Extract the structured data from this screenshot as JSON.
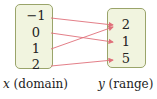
{
  "diagram": {
    "title": "",
    "domain": {
      "label_var": "x",
      "label_text": "(domain)",
      "values": [
        "−1",
        "0",
        "1",
        "2"
      ]
    },
    "range": {
      "label_var": "y",
      "label_text": "(range)",
      "values": [
        "2",
        "1",
        "5"
      ]
    },
    "mappings": [
      {
        "from": "−1",
        "to": "2"
      },
      {
        "from": "0",
        "to": "1"
      },
      {
        "from": "1",
        "to": "2"
      },
      {
        "from": "2",
        "to": "5"
      }
    ],
    "colors": {
      "box_fill": "#f1f4df",
      "box_border": "#9aa46a",
      "arrow": "#e0707a",
      "text": "#222222"
    }
  }
}
